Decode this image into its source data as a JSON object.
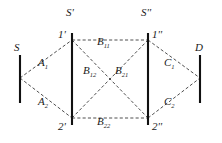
{
  "figure": {
    "type": "network-diagram",
    "background_color": "#ffffff",
    "line_color": "#3a3a3a",
    "bar_color": "#111111"
  },
  "terminals": {
    "source": {
      "label": "S",
      "x": 20,
      "y": 78,
      "bar_top": 55,
      "bar_bottom": 103
    },
    "destination": {
      "label": "D",
      "x": 200,
      "y": 78,
      "bar_top": 55,
      "bar_bottom": 103
    },
    "stage_one": {
      "label": "S'",
      "label_x": 72,
      "label_y": 12
    },
    "stage_two": {
      "label": "S''",
      "label_x": 148,
      "label_y": 12
    }
  },
  "nodes": [
    {
      "id": "n1p",
      "label": "1'",
      "x": 72,
      "y": 40,
      "label_x": 60,
      "label_y": 36,
      "bar_top": 33,
      "bar_bottom": 125
    },
    {
      "id": "n2p",
      "label": "2'",
      "x": 72,
      "y": 118,
      "label_x": 60,
      "label_y": 127,
      "bar_top": 33,
      "bar_bottom": 125
    },
    {
      "id": "n1pp",
      "label": "1''",
      "x": 148,
      "y": 40,
      "label_x": 152,
      "label_y": 36,
      "bar_top": 33,
      "bar_bottom": 125
    },
    {
      "id": "n2pp",
      "label": "2''",
      "x": 148,
      "y": 118,
      "label_x": 152,
      "label_y": 127,
      "bar_top": 33,
      "bar_bottom": 125
    }
  ],
  "edges": [
    {
      "id": "e_a1",
      "base": "A",
      "sub": "1",
      "from": "S",
      "to": "1'",
      "x1": 20,
      "y1": 78,
      "x2": 72,
      "y2": 40,
      "label_x": 42,
      "label_y": 64
    },
    {
      "id": "e_a2",
      "base": "A",
      "sub": "2",
      "from": "S",
      "to": "2'",
      "x1": 20,
      "y1": 78,
      "x2": 72,
      "y2": 118,
      "label_x": 42,
      "label_y": 103
    },
    {
      "id": "e_b11",
      "base": "B",
      "sub": "11",
      "from": "1'",
      "to": "1''",
      "x1": 72,
      "y1": 40,
      "x2": 148,
      "y2": 40,
      "label_x": 100,
      "label_y": 45
    },
    {
      "id": "e_b12",
      "base": "B",
      "sub": "12",
      "from": "1'",
      "to": "2''",
      "x1": 72,
      "y1": 40,
      "x2": 148,
      "y2": 118,
      "label_x": 87,
      "label_y": 72
    },
    {
      "id": "e_b21",
      "base": "B",
      "sub": "21",
      "from": "2'",
      "to": "1''",
      "x1": 72,
      "y1": 118,
      "x2": 148,
      "y2": 40,
      "label_x": 119,
      "label_y": 72
    },
    {
      "id": "e_b22",
      "base": "B",
      "sub": "22",
      "from": "2'",
      "to": "2''",
      "x1": 72,
      "y1": 118,
      "x2": 148,
      "y2": 118,
      "label_x": 100,
      "label_y": 123
    },
    {
      "id": "e_c1",
      "base": "C",
      "sub": "1",
      "from": "1''",
      "to": "D",
      "x1": 148,
      "y1": 40,
      "x2": 200,
      "y2": 78,
      "label_x": 168,
      "label_y": 64
    },
    {
      "id": "e_c2",
      "base": "C",
      "sub": "2",
      "from": "2''",
      "to": "D",
      "x1": 148,
      "y1": 118,
      "x2": 200,
      "y2": 78,
      "label_x": 168,
      "label_y": 103
    }
  ]
}
